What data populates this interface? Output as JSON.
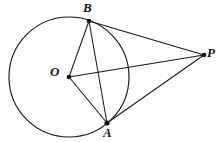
{
  "figure": {
    "kind": "geometry-diagram",
    "background_color": "#fdfdfd",
    "stroke_color": "#1a1a1a",
    "label_color": "#141414",
    "canvas": {
      "width": 218,
      "height": 142
    },
    "circle": {
      "name": "main-circle",
      "center_x": 69,
      "center_y": 77,
      "radius": 60
    },
    "points": [
      {
        "id": "B",
        "label": "B",
        "x": 89,
        "y": 21,
        "label_x": 83,
        "label_y": 1,
        "on_circle": true
      },
      {
        "id": "P",
        "label": "P",
        "x": 204,
        "y": 55,
        "label_x": 207,
        "label_y": 46,
        "on_circle": false
      },
      {
        "id": "O",
        "label": "O",
        "x": 69,
        "y": 77,
        "label_x": 50,
        "label_y": 65,
        "on_circle": false
      },
      {
        "id": "A",
        "label": "A",
        "x": 107,
        "y": 123,
        "label_x": 103,
        "label_y": 126,
        "on_circle": true
      }
    ],
    "segments": [
      {
        "id": "OB",
        "from": "O",
        "to": "B",
        "role": "radius"
      },
      {
        "id": "OA",
        "from": "O",
        "to": "A",
        "role": "radius"
      },
      {
        "id": "OP",
        "from": "O",
        "to": "P",
        "role": "center-to-external-point"
      },
      {
        "id": "BA",
        "from": "B",
        "to": "A",
        "role": "chord"
      },
      {
        "id": "BP",
        "from": "B",
        "to": "P",
        "role": "tangent"
      },
      {
        "id": "AP",
        "from": "A",
        "to": "P",
        "role": "tangent"
      }
    ]
  }
}
